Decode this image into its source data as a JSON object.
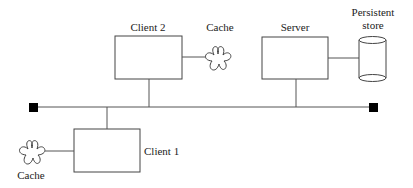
{
  "diagram": {
    "nodes": {
      "client2": {
        "label": "Client 2"
      },
      "client2_cache": {
        "label": "Cache"
      },
      "server": {
        "label": "Server"
      },
      "store": {
        "label_line1": "Persistent",
        "label_line2": "store"
      },
      "client1": {
        "label": "Client 1"
      },
      "client1_cache": {
        "label": "Cache"
      }
    },
    "edges": [
      {
        "from": "client2",
        "to": "client2_cache"
      },
      {
        "from": "client2",
        "to": "bus"
      },
      {
        "from": "server",
        "to": "store"
      },
      {
        "from": "server",
        "to": "bus"
      },
      {
        "from": "client1",
        "to": "bus"
      },
      {
        "from": "client1",
        "to": "client1_cache"
      }
    ],
    "bus": {
      "terminators": 2
    }
  }
}
